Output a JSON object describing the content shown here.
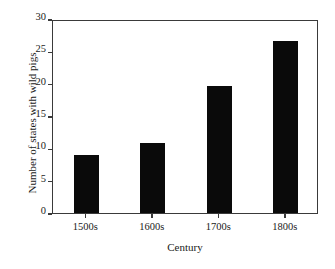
{
  "chart_data": {
    "type": "bar",
    "title": "",
    "xlabel": "Century",
    "ylabel": "Number of states with wild pigs",
    "categories": [
      "1500s",
      "1600s",
      "1700s",
      "1800s"
    ],
    "values": [
      9.0,
      10.8,
      19.6,
      26.6
    ],
    "ylim": [
      0,
      30
    ],
    "yticks": [
      0,
      5,
      10,
      15,
      20,
      25,
      30
    ],
    "ytick_labels": [
      "0",
      "5",
      "10",
      "15",
      "20",
      "25",
      "30"
    ],
    "grid": false,
    "legend": false,
    "bar_color": "#0a0a0a",
    "frame_color": "#3a3a3a",
    "background_color": "#ffffff"
  }
}
